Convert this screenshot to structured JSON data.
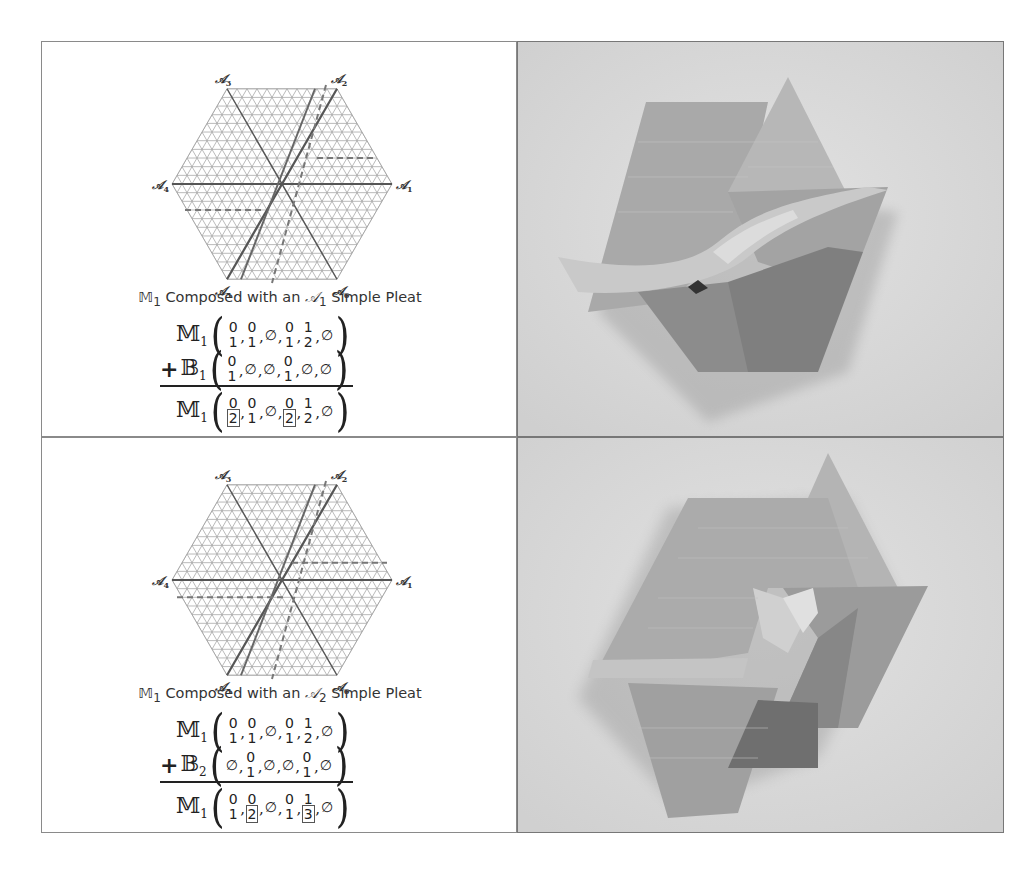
{
  "panels": [
    {
      "diagram": {
        "axis_labels": [
          "𝒜1",
          "𝒜2",
          "𝒜3",
          "𝒜4",
          "𝒜5",
          "𝒜6"
        ],
        "solid_pleat": "A2 direction (thick line through center offset)",
        "dashed_lines": "horizontal dashes (A1 simple pleat) and A2 dashes"
      },
      "caption": {
        "prefix": "𝕄",
        "prefix_sub": "1",
        "text_a": " Composed with an ",
        "axis": "𝒜",
        "axis_sub": "1",
        "text_b": " Simple Pleat"
      },
      "eq": {
        "line1": {
          "op": "",
          "sym": "𝕄",
          "sub": "1",
          "entries": [
            [
              "0",
              "1"
            ],
            [
              "0",
              "1"
            ],
            [
              "",
              "∅"
            ],
            [
              "0",
              "1"
            ],
            [
              "1",
              "2"
            ],
            [
              "",
              "∅"
            ]
          ]
        },
        "line2": {
          "op": "+",
          "sym": "𝔹",
          "sub": "1",
          "entries": [
            [
              "0",
              "1"
            ],
            [
              "",
              "∅"
            ],
            [
              "",
              "∅"
            ],
            [
              "0",
              "1"
            ],
            [
              "",
              "∅"
            ],
            [
              "",
              "∅"
            ]
          ]
        },
        "result": {
          "op": "",
          "sym": "𝕄",
          "sub": "1",
          "entries": [
            [
              "0",
              "2*"
            ],
            [
              "0",
              "1"
            ],
            [
              "",
              "∅"
            ],
            [
              "0",
              "2*"
            ],
            [
              "1",
              "2"
            ],
            [
              "",
              "∅"
            ]
          ]
        }
      },
      "photo_alt": "Folded origami tessellation photo, A1 simple pleat composition"
    },
    {
      "diagram": {
        "axis_labels": [
          "𝒜1",
          "𝒜2",
          "𝒜3",
          "𝒜4",
          "𝒜5",
          "𝒜6"
        ]
      },
      "caption": {
        "prefix": "𝕄",
        "prefix_sub": "1",
        "text_a": " Composed with an ",
        "axis": "𝒜",
        "axis_sub": "2",
        "text_b": " Simple Pleat"
      },
      "eq": {
        "line1": {
          "op": "",
          "sym": "𝕄",
          "sub": "1",
          "entries": [
            [
              "0",
              "1"
            ],
            [
              "0",
              "1"
            ],
            [
              "",
              "∅"
            ],
            [
              "0",
              "1"
            ],
            [
              "1",
              "2"
            ],
            [
              "",
              "∅"
            ]
          ]
        },
        "line2": {
          "op": "+",
          "sym": "𝔹",
          "sub": "2",
          "entries": [
            [
              "",
              "∅"
            ],
            [
              "0",
              "1"
            ],
            [
              "",
              "∅"
            ],
            [
              "",
              "∅"
            ],
            [
              "0",
              "1"
            ],
            [
              "",
              "∅"
            ]
          ]
        },
        "result": {
          "op": "",
          "sym": "𝕄",
          "sub": "1",
          "entries": [
            [
              "0",
              "1"
            ],
            [
              "0",
              "2*"
            ],
            [
              "",
              "∅"
            ],
            [
              "0",
              "1"
            ],
            [
              "1",
              "3*"
            ],
            [
              "",
              "∅"
            ]
          ]
        }
      },
      "photo_alt": "Folded origami tessellation photo, A2 simple pleat composition"
    }
  ]
}
